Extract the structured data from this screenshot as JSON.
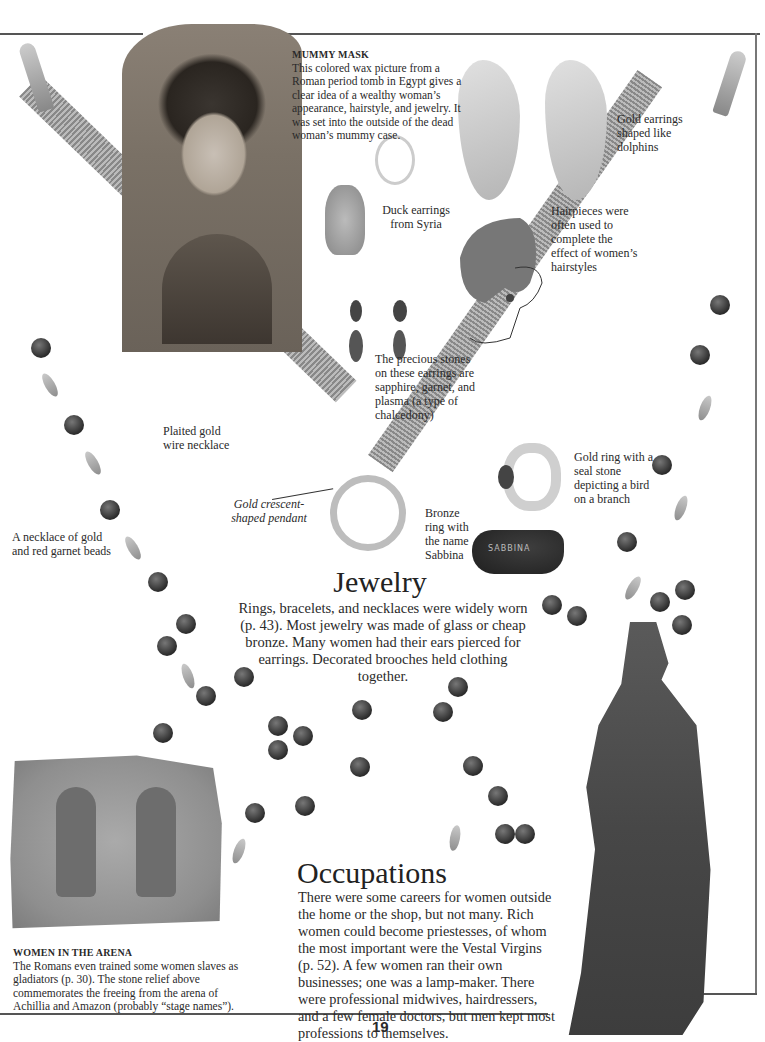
{
  "page": {
    "number": "19",
    "background": "#ffffff",
    "rule_color": "#555555"
  },
  "captions": {
    "mummy_mask": {
      "title": "MUMMY MASK",
      "text": "This colored wax picture from a Roman period tomb in Egypt gives a clear idea of a wealthy woman’s appearance, hairstyle, and jewelry. It was set into the outside of the dead woman’s mummy case."
    },
    "dolphin_earrings": "Gold earrings shaped like dolphins",
    "duck_earrings": "Duck earrings from Syria",
    "hairpieces": "Hairpieces were often used to complete the effect of women’s hairstyles",
    "precious_stones": "The precious stones on these earrings are sapphire, garnet, and plasma (a type of chalcedony)",
    "gold_necklace": "Plaited gold wire necklace",
    "pendant": "Gold crescent-shaped pendant",
    "gold_ring": "Gold ring with a seal stone depicting a bird on a branch",
    "bronze_ring": "Bronze ring with the name Sabbina",
    "bronze_ring_inscription": "SABBINA",
    "garnet_necklace": "A necklace of gold and red garnet beads",
    "women_arena": {
      "title": "WOMEN IN THE ARENA",
      "text": "The Romans even trained some women slaves as gladiators (p. 30). The stone relief above commemorates the freeing from the arena of Achillia and Amazon (probably “stage names”)."
    }
  },
  "sections": {
    "jewelry": {
      "heading": "Jewelry",
      "body": "Rings, bracelets, and necklaces were widely worn (p. 43). Most jewelry was made of glass or cheap bronze. Many women had their ears pierced for earrings. Decorated brooches held clothing together."
    },
    "occupations": {
      "heading": "Occupations",
      "body": "There were some careers for women outside the home or the shop, but not many. Rich women could become priestesses, of whom the most important were the Vestal Virgins (p. 52). A few women ran their own businesses; one was a lamp-maker. There were professional midwives, hairdressers, and a few female doctors, but men kept most professions to themselves."
    }
  },
  "images": [
    {
      "name": "mummy-portrait",
      "alt": "Colored wax portrait of a Roman-period woman"
    },
    {
      "name": "dolphin-earrings",
      "alt": "Pair of gold dolphin earrings"
    },
    {
      "name": "duck-earrings",
      "alt": "Pair of duck earrings"
    },
    {
      "name": "hairstyle-sketch",
      "alt": "Line drawing of woman with elaborate hairpiece"
    },
    {
      "name": "stone-earrings",
      "alt": "Earrings with precious stones"
    },
    {
      "name": "plaited-gold-necklace",
      "alt": "Plaited gold wire necklace with ring pendant"
    },
    {
      "name": "gold-seal-ring",
      "alt": "Gold ring with seal stone"
    },
    {
      "name": "bronze-ring",
      "alt": "Bronze ring inscribed Sabbina"
    },
    {
      "name": "garnet-necklace",
      "alt": "Necklace of gold and red garnet beads"
    },
    {
      "name": "gladiator-relief",
      "alt": "Stone relief of two female gladiators"
    },
    {
      "name": "bronze-statue",
      "alt": "Statue of draped Roman woman"
    }
  ]
}
